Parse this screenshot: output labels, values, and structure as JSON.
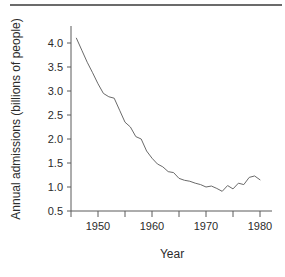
{
  "figure": {
    "name": "annual-admissions-line-chart",
    "background": "#ffffff",
    "line_color": "#6a6a6a",
    "axis_color": "#5a5a5a",
    "text_color": "#2b2b2b",
    "rule_color": "#6b6b6b"
  },
  "chart_data": {
    "type": "line",
    "title": "",
    "subtitle": "",
    "xlabel": "Year",
    "ylabel": "Annual admissions (billions of people)",
    "xlim": [
      1945,
      1982
    ],
    "ylim": [
      0.5,
      4.35
    ],
    "grid": false,
    "legend": null,
    "xticks": [
      1945,
      1950,
      1955,
      1960,
      1965,
      1970,
      1975,
      1980
    ],
    "xticklabels": [
      "",
      "1950",
      "",
      "1960",
      "",
      "1970",
      "",
      "1980"
    ],
    "yticks": [
      0.5,
      1.0,
      1.5,
      2.0,
      2.5,
      3.0,
      3.5,
      4.0
    ],
    "yticklabels": [
      "0.5",
      "1.0",
      "1.5",
      "2.0",
      "2.5",
      "3.0",
      "3.5",
      "4.0"
    ],
    "series": [
      {
        "name": "Annual admissions",
        "x": [
          1946,
          1947,
          1948,
          1949,
          1950,
          1951,
          1952,
          1953,
          1954,
          1955,
          1956,
          1957,
          1958,
          1959,
          1960,
          1961,
          1962,
          1963,
          1964,
          1965,
          1966,
          1967,
          1968,
          1969,
          1970,
          1971,
          1972,
          1973,
          1974,
          1975,
          1976,
          1977,
          1978,
          1979,
          1980
        ],
        "values": [
          4.1,
          3.85,
          3.6,
          3.38,
          3.15,
          2.95,
          2.88,
          2.85,
          2.6,
          2.35,
          2.25,
          2.05,
          2.0,
          1.75,
          1.6,
          1.48,
          1.42,
          1.32,
          1.3,
          1.18,
          1.14,
          1.12,
          1.08,
          1.05,
          1.0,
          1.02,
          0.97,
          0.91,
          1.03,
          0.96,
          1.08,
          1.05,
          1.2,
          1.23,
          1.15
        ]
      }
    ]
  }
}
